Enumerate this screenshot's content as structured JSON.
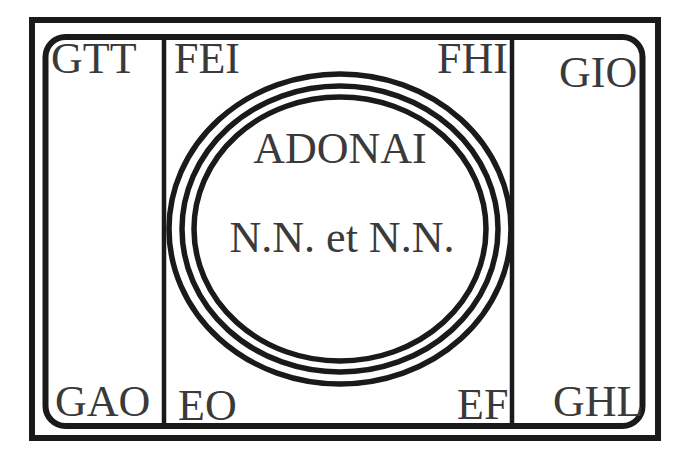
{
  "diagram": {
    "type": "magic-seal-layout",
    "colors": {
      "stroke": "#1a1a1a",
      "text": "#3a3a3a",
      "background": "#ffffff"
    },
    "corners": {
      "top_left": "GTT",
      "top_right": "GIO",
      "bottom_left": "GAO",
      "bottom_right": "GHL"
    },
    "center_panel_corners": {
      "top_left": "FEI",
      "top_right": "FHI",
      "bottom_left": "EO",
      "bottom_right": "EF"
    },
    "circle": {
      "rings": 3,
      "title": "ADONAI",
      "subtitle": "N.N. et N.N."
    }
  }
}
